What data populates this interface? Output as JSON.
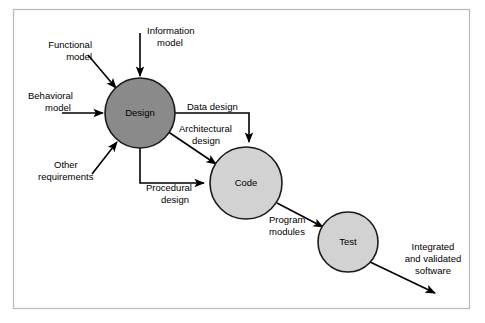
{
  "figure": {
    "background_color": "#ffffff",
    "frame_border_color": "#b9b9b9"
  },
  "nodes": [
    {
      "id": "design",
      "label": "Design",
      "fill": "#8a8a8a",
      "stroke": "#1a1a1a",
      "cx": 140,
      "cy": 113,
      "r": 35
    },
    {
      "id": "code",
      "label": "Code",
      "fill": "#d2d2d2",
      "stroke": "#1a1a1a",
      "cx": 246,
      "cy": 183,
      "r": 36
    },
    {
      "id": "test",
      "label": "Test",
      "fill": "#d2d2d2",
      "stroke": "#1a1a1a",
      "cx": 348,
      "cy": 242,
      "r": 30
    }
  ],
  "inputs": [
    {
      "id": "functional-model",
      "line1": "Functional",
      "line2": "model"
    },
    {
      "id": "information-model",
      "line1": "Information",
      "line2": "model"
    },
    {
      "id": "behavioral-model",
      "line1": "Behavioral",
      "line2": "model"
    },
    {
      "id": "other-requirements",
      "line1": "Other",
      "line2": "requirements"
    }
  ],
  "edges": [
    {
      "id": "data-design",
      "line1": "Data design",
      "line2": "",
      "from": "design",
      "to": "code"
    },
    {
      "id": "architectural-design",
      "line1": "Architectural",
      "line2": "design",
      "from": "design",
      "to": "code"
    },
    {
      "id": "procedural-design",
      "line1": "Procedural",
      "line2": "design",
      "from": "design",
      "to": "code"
    },
    {
      "id": "program-modules",
      "line1": "Program",
      "line2": "modules",
      "from": "code",
      "to": "test"
    }
  ],
  "outputs": [
    {
      "id": "integrated-validated-software",
      "line1": "Integrated",
      "line2": "and validated",
      "line3": "software",
      "from": "test"
    }
  ]
}
